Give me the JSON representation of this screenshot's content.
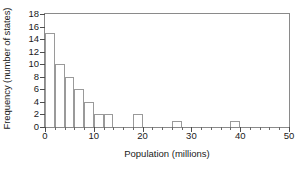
{
  "chart_data": {
    "type": "bar",
    "title": "",
    "subtitle": "",
    "xlabel": "Population (millions)",
    "ylabel": "Frequency (number of states)",
    "xlim": [
      0,
      50
    ],
    "ylim": [
      0,
      18
    ],
    "grid": false,
    "legend": null,
    "bin_width": 2,
    "x_major_ticks": [
      0,
      10,
      20,
      30,
      40,
      50
    ],
    "x_major_tick_labels": [
      "0",
      "10",
      "20",
      "30",
      "40",
      "50"
    ],
    "x_minor_ticks": [
      2,
      4,
      6,
      8,
      12,
      14,
      16,
      18,
      22,
      24,
      26,
      28,
      32,
      34,
      36,
      38,
      42,
      44,
      46,
      48
    ],
    "y_major_ticks": [
      0,
      2,
      4,
      6,
      8,
      10,
      12,
      14,
      16,
      18
    ],
    "y_major_tick_labels": [
      "0",
      "2",
      "4",
      "6",
      "8",
      "10",
      "12",
      "14",
      "16",
      "18"
    ],
    "bins": [
      {
        "start": 0,
        "end": 2,
        "value": 15
      },
      {
        "start": 2,
        "end": 4,
        "value": 10
      },
      {
        "start": 4,
        "end": 6,
        "value": 8
      },
      {
        "start": 6,
        "end": 8,
        "value": 6
      },
      {
        "start": 8,
        "end": 10,
        "value": 4
      },
      {
        "start": 10,
        "end": 12,
        "value": 2
      },
      {
        "start": 12,
        "end": 14,
        "value": 2
      },
      {
        "start": 14,
        "end": 16,
        "value": 0
      },
      {
        "start": 16,
        "end": 18,
        "value": 0
      },
      {
        "start": 18,
        "end": 20,
        "value": 2
      },
      {
        "start": 20,
        "end": 22,
        "value": 0
      },
      {
        "start": 22,
        "end": 24,
        "value": 0
      },
      {
        "start": 24,
        "end": 26,
        "value": 0
      },
      {
        "start": 26,
        "end": 28,
        "value": 1
      },
      {
        "start": 28,
        "end": 30,
        "value": 0
      },
      {
        "start": 30,
        "end": 32,
        "value": 0
      },
      {
        "start": 32,
        "end": 34,
        "value": 0
      },
      {
        "start": 34,
        "end": 36,
        "value": 0
      },
      {
        "start": 36,
        "end": 38,
        "value": 0
      },
      {
        "start": 38,
        "end": 40,
        "value": 1
      },
      {
        "start": 40,
        "end": 42,
        "value": 0
      },
      {
        "start": 42,
        "end": 44,
        "value": 0
      },
      {
        "start": 44,
        "end": 46,
        "value": 0
      },
      {
        "start": 46,
        "end": 48,
        "value": 0
      },
      {
        "start": 48,
        "end": 50,
        "value": 0
      }
    ],
    "categories": [
      "0-2",
      "2-4",
      "4-6",
      "6-8",
      "8-10",
      "10-12",
      "12-14",
      "14-16",
      "16-18",
      "18-20",
      "20-22",
      "22-24",
      "24-26",
      "26-28",
      "28-30",
      "30-32",
      "32-34",
      "34-36",
      "36-38",
      "38-40",
      "40-42",
      "42-44",
      "44-46",
      "46-48",
      "48-50"
    ],
    "values": [
      15,
      10,
      8,
      6,
      4,
      2,
      2,
      0,
      0,
      2,
      0,
      0,
      0,
      1,
      0,
      0,
      0,
      0,
      0,
      1,
      0,
      0,
      0,
      0,
      0
    ],
    "colors": {
      "bar_edge": "#9a9a9a",
      "bar_fill": "transparent",
      "axis": "#4d4d4d",
      "frame": "#8a8a8a",
      "text": "#1a1a1a",
      "background": "#ffffff"
    }
  }
}
